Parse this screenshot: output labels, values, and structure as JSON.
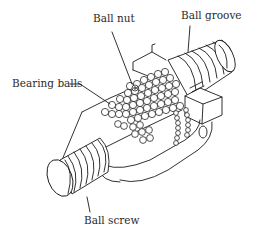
{
  "diagram": {
    "type": "labeled-illustration",
    "labels": [
      {
        "id": "ball_nut",
        "text": "Ball nut"
      },
      {
        "id": "ball_groove",
        "text": "Ball groove"
      },
      {
        "id": "bearing_balls",
        "text": "Bearing balls"
      },
      {
        "id": "ball_screw",
        "text": "Ball screw"
      }
    ],
    "colors": {
      "ink": "#1a1a1a",
      "background": "#ffffff"
    }
  }
}
